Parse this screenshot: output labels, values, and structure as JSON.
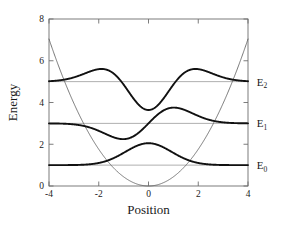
{
  "chart_data": {
    "type": "line",
    "title": "",
    "xlabel": "Position",
    "ylabel": "Energy",
    "xlim": [
      -4,
      4
    ],
    "ylim": [
      0,
      8
    ],
    "xticks": [
      -4,
      -2,
      0,
      2,
      4
    ],
    "yticks": [
      0,
      2,
      4,
      6,
      8
    ],
    "xtick_labels": [
      "-4",
      "-2",
      "0",
      "2",
      "4"
    ],
    "ytick_labels": [
      "0",
      "2",
      "4",
      "6",
      "8"
    ],
    "grid": false,
    "legend": "none",
    "annotations": [
      {
        "text": "E",
        "sub": "2",
        "x": 4.35,
        "y": 5.0,
        "name": "energy-level-label-e2"
      },
      {
        "text": "E",
        "sub": "1",
        "x": 4.35,
        "y": 3.0,
        "name": "energy-level-label-e1"
      },
      {
        "text": "E",
        "sub": "0",
        "x": 4.35,
        "y": 1.0,
        "name": "energy-level-label-e0"
      }
    ],
    "series": [
      {
        "name": "potential",
        "label": "Harmonic potential V(x)",
        "kind": "parabola",
        "color": "#555555",
        "width": 0.8,
        "coefficient": 0.44,
        "vertex": [
          0,
          0
        ],
        "endpoints": [
          {
            "x": -4,
            "y": 7.05
          },
          {
            "x": 4,
            "y": 7.05
          }
        ]
      },
      {
        "name": "baseline-e0",
        "label": "E0 baseline",
        "kind": "hline",
        "color": "#8c8c8c",
        "width": 0.7,
        "y": 1.0
      },
      {
        "name": "baseline-e1",
        "label": "E1 baseline",
        "kind": "hline",
        "color": "#8c8c8c",
        "width": 0.7,
        "y": 3.0
      },
      {
        "name": "baseline-e2",
        "label": "E2 baseline",
        "kind": "hline",
        "color": "#8c8c8c",
        "width": 0.7,
        "y": 5.0
      },
      {
        "name": "wavefunction-n0",
        "label": "Ground state n=0",
        "kind": "wavefunction",
        "n": 0,
        "color": "#111111",
        "width": 1.9,
        "offset": 1.0,
        "amplitude": 1.05,
        "alpha": 0.58,
        "peak": {
          "x": 0,
          "y": 2.05
        },
        "nodes": []
      },
      {
        "name": "wavefunction-n1",
        "label": "First excited state n=1",
        "kind": "wavefunction",
        "n": 1,
        "color": "#111111",
        "width": 1.9,
        "offset": 3.0,
        "amplitude": 0.88,
        "alpha": 0.48,
        "extrema": [
          {
            "x": -1.0,
            "y": 2.4
          },
          {
            "x": 1.05,
            "y": 3.62
          }
        ],
        "nodes": [
          0
        ]
      },
      {
        "name": "wavefunction-n2",
        "label": "Second excited state n=2",
        "kind": "wavefunction",
        "n": 2,
        "color": "#111111",
        "width": 1.9,
        "offset": 5.0,
        "amplitude": 0.68,
        "alpha": 0.42,
        "extrema": [
          {
            "x": -1.62,
            "y": 6.32
          },
          {
            "x": 0,
            "y": 4.05
          },
          {
            "x": 1.62,
            "y": 6.32
          }
        ],
        "nodes": [
          -0.78,
          0.78
        ]
      }
    ]
  },
  "figure": {
    "plot_area": {
      "left": 49,
      "top": 19,
      "right": 248,
      "bottom": 186
    },
    "frame_color": "#6e6e6e",
    "background": "#ffffff"
  }
}
